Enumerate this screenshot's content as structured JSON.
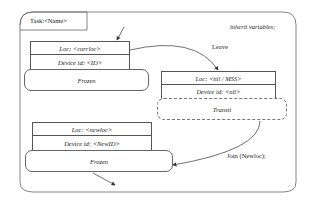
{
  "task_tab": {
    "label": "Task:<Name>"
  },
  "inherit_label": "inherit variables;",
  "transitions": {
    "leave": "Leave",
    "join": "Join (Newloc);"
  },
  "states": [
    {
      "loc": "Loc: <currloc>",
      "device": "Device id: <ID>",
      "state": "Frozen",
      "style": "solid"
    },
    {
      "loc": "Loc: <nil / MSS>",
      "device": "Device id: <nil>",
      "state": "Transit",
      "style": "dashed"
    },
    {
      "loc": "Loc: <newloc>",
      "device": "Device id: <NewID>",
      "state": "Frozen",
      "style": "solid"
    }
  ],
  "colors": {
    "line": "#555555",
    "background": "#ffffff",
    "text": "#222222"
  }
}
